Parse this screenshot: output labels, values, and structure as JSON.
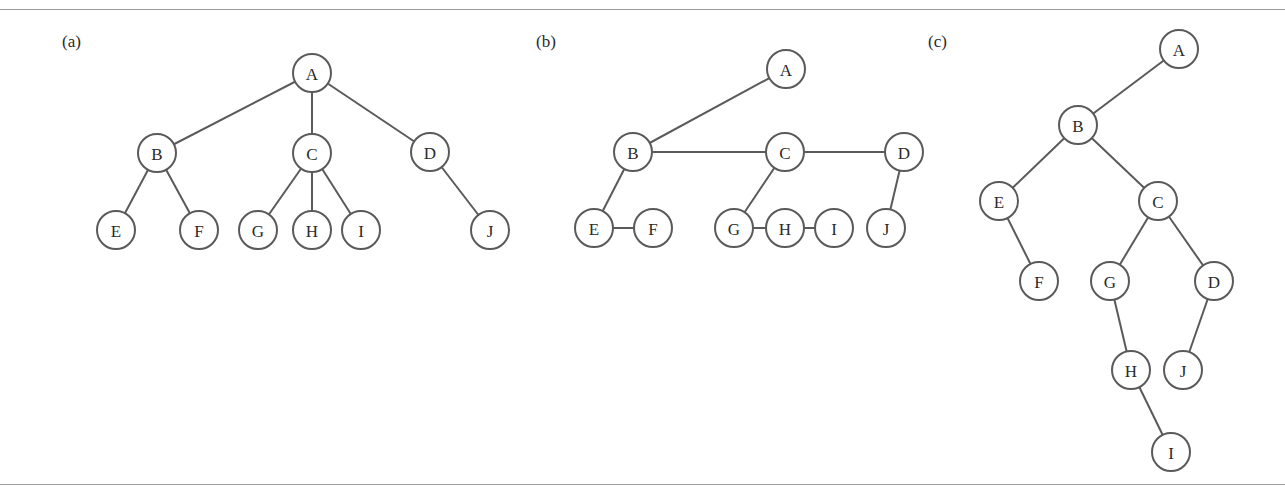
{
  "figure": {
    "node_radius": 19,
    "colors": {
      "stroke": "#5a5a5a",
      "text": "#2a2a2a",
      "rule": "#9a9a9a",
      "background": "#ffffff"
    },
    "rules": {
      "top_y": 9,
      "bottom_y": 484
    },
    "panels": [
      {
        "label": "(a)",
        "label_pos": [
          62,
          32
        ],
        "nodes": [
          {
            "id": "A",
            "x": 312,
            "y": 73
          },
          {
            "id": "B",
            "x": 157,
            "y": 153
          },
          {
            "id": "C",
            "x": 312,
            "y": 153
          },
          {
            "id": "D",
            "x": 430,
            "y": 152
          },
          {
            "id": "E",
            "x": 116,
            "y": 230
          },
          {
            "id": "F",
            "x": 199,
            "y": 230
          },
          {
            "id": "G",
            "x": 258,
            "y": 230
          },
          {
            "id": "H",
            "x": 312,
            "y": 230
          },
          {
            "id": "I",
            "x": 361,
            "y": 230
          },
          {
            "id": "J",
            "x": 490,
            "y": 230
          }
        ],
        "edges": [
          [
            "A",
            "B"
          ],
          [
            "A",
            "C"
          ],
          [
            "A",
            "D"
          ],
          [
            "B",
            "E"
          ],
          [
            "B",
            "F"
          ],
          [
            "C",
            "G"
          ],
          [
            "C",
            "H"
          ],
          [
            "C",
            "I"
          ],
          [
            "D",
            "J"
          ]
        ]
      },
      {
        "label": "(b)",
        "label_pos": [
          536,
          32
        ],
        "nodes": [
          {
            "id": "A",
            "x": 786,
            "y": 69
          },
          {
            "id": "B",
            "x": 633,
            "y": 152
          },
          {
            "id": "C",
            "x": 785,
            "y": 152
          },
          {
            "id": "D",
            "x": 904,
            "y": 152
          },
          {
            "id": "E",
            "x": 594,
            "y": 228
          },
          {
            "id": "F",
            "x": 653,
            "y": 228
          },
          {
            "id": "G",
            "x": 734,
            "y": 228
          },
          {
            "id": "H",
            "x": 785,
            "y": 228
          },
          {
            "id": "I",
            "x": 834,
            "y": 228
          },
          {
            "id": "J",
            "x": 886,
            "y": 228
          }
        ],
        "edges": [
          [
            "A",
            "B"
          ],
          [
            "B",
            "C"
          ],
          [
            "C",
            "D"
          ],
          [
            "B",
            "E"
          ],
          [
            "E",
            "F"
          ],
          [
            "C",
            "G"
          ],
          [
            "G",
            "H"
          ],
          [
            "H",
            "I"
          ],
          [
            "D",
            "J"
          ]
        ]
      },
      {
        "label": "(c)",
        "label_pos": [
          928,
          32
        ],
        "nodes": [
          {
            "id": "A",
            "x": 1179,
            "y": 49
          },
          {
            "id": "B",
            "x": 1078,
            "y": 125
          },
          {
            "id": "E",
            "x": 999,
            "y": 201
          },
          {
            "id": "C",
            "x": 1158,
            "y": 201
          },
          {
            "id": "F",
            "x": 1039,
            "y": 281
          },
          {
            "id": "G",
            "x": 1110,
            "y": 281
          },
          {
            "id": "D",
            "x": 1214,
            "y": 281
          },
          {
            "id": "H",
            "x": 1131,
            "y": 370
          },
          {
            "id": "J",
            "x": 1183,
            "y": 370
          },
          {
            "id": "I",
            "x": 1171,
            "y": 452
          }
        ],
        "edges": [
          [
            "A",
            "B"
          ],
          [
            "B",
            "E"
          ],
          [
            "B",
            "C"
          ],
          [
            "E",
            "F"
          ],
          [
            "C",
            "G"
          ],
          [
            "C",
            "D"
          ],
          [
            "G",
            "H"
          ],
          [
            "D",
            "J"
          ],
          [
            "H",
            "I"
          ]
        ]
      }
    ]
  }
}
